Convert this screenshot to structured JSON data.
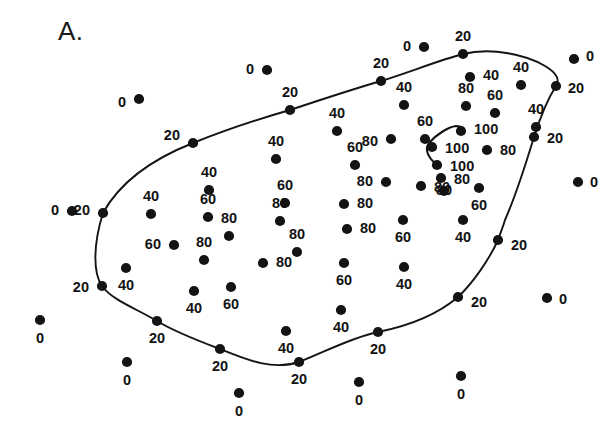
{
  "figure": {
    "panel_label": "A.",
    "marker_color": "#141414",
    "contour_color": "#141414",
    "background_color": "#ffffff"
  },
  "chart_data": {
    "type": "scatter",
    "title": "A.",
    "subtitle": "",
    "xlabel": "",
    "ylabel": "",
    "xlim": [
      0,
      615
    ],
    "ylim": [
      0,
      428
    ],
    "grid": false,
    "legend": "none",
    "value_label_key": "Percent value annotated beside each sampled point",
    "contour_levels": [
      20,
      100
    ],
    "series": [
      {
        "name": "Sampled points with percent labels",
        "points": [
          {
            "x": 267,
            "y": 70,
            "value": "0",
            "lx": 254,
            "ly": 70,
            "anchor": "end"
          },
          {
            "x": 139,
            "y": 99,
            "value": "0",
            "lx": 126,
            "ly": 103,
            "anchor": "end"
          },
          {
            "x": 424,
            "y": 47,
            "value": "0",
            "lx": 411,
            "ly": 47,
            "anchor": "end"
          },
          {
            "x": 574,
            "y": 59,
            "value": "0",
            "lx": 586,
            "ly": 57,
            "anchor": "start"
          },
          {
            "x": 578,
            "y": 182,
            "value": "0",
            "lx": 590,
            "ly": 183,
            "anchor": "start"
          },
          {
            "x": 547,
            "y": 298,
            "value": "0",
            "lx": 559,
            "ly": 300,
            "anchor": "start"
          },
          {
            "x": 72,
            "y": 211,
            "value": "0",
            "lx": 59,
            "ly": 211,
            "anchor": "end"
          },
          {
            "x": 40,
            "y": 320,
            "value": "0",
            "lx": 40,
            "ly": 339,
            "anchor": "middle"
          },
          {
            "x": 127,
            "y": 362,
            "value": "0",
            "lx": 127,
            "ly": 381,
            "anchor": "middle"
          },
          {
            "x": 239,
            "y": 393,
            "value": "0",
            "lx": 239,
            "ly": 412,
            "anchor": "middle"
          },
          {
            "x": 359,
            "y": 382,
            "value": "0",
            "lx": 359,
            "ly": 401,
            "anchor": "middle"
          },
          {
            "x": 461,
            "y": 376,
            "value": "0",
            "lx": 461,
            "ly": 395,
            "anchor": "middle"
          },
          {
            "x": 290,
            "y": 110,
            "value": "20",
            "lx": 290,
            "ly": 93,
            "anchor": "middle"
          },
          {
            "x": 193,
            "y": 143,
            "value": "20",
            "lx": 180,
            "ly": 136,
            "anchor": "end"
          },
          {
            "x": 381,
            "y": 81,
            "value": "20",
            "lx": 381,
            "ly": 64,
            "anchor": "middle"
          },
          {
            "x": 463,
            "y": 54,
            "value": "20",
            "lx": 463,
            "ly": 37,
            "anchor": "middle"
          },
          {
            "x": 556,
            "y": 86,
            "value": "20",
            "lx": 568,
            "ly": 89,
            "anchor": "start"
          },
          {
            "x": 534,
            "y": 137,
            "value": "20",
            "lx": 547,
            "ly": 139,
            "anchor": "start"
          },
          {
            "x": 498,
            "y": 240,
            "value": "20",
            "lx": 511,
            "ly": 246,
            "anchor": "start"
          },
          {
            "x": 458,
            "y": 297,
            "value": "20",
            "lx": 471,
            "ly": 303,
            "anchor": "start"
          },
          {
            "x": 378,
            "y": 332,
            "value": "20",
            "lx": 378,
            "ly": 350,
            "anchor": "middle"
          },
          {
            "x": 299,
            "y": 362,
            "value": "20",
            "lx": 299,
            "ly": 380,
            "anchor": "middle"
          },
          {
            "x": 220,
            "y": 349,
            "value": "20",
            "lx": 220,
            "ly": 367,
            "anchor": "middle"
          },
          {
            "x": 157,
            "y": 321,
            "value": "20",
            "lx": 157,
            "ly": 339,
            "anchor": "middle"
          },
          {
            "x": 102,
            "y": 286,
            "value": "20",
            "lx": 89,
            "ly": 288,
            "anchor": "end"
          },
          {
            "x": 103,
            "y": 213,
            "value": "20",
            "lx": 90,
            "ly": 211,
            "anchor": "end"
          },
          {
            "x": 151,
            "y": 214,
            "value": "40",
            "lx": 151,
            "ly": 197,
            "anchor": "middle"
          },
          {
            "x": 209,
            "y": 190,
            "value": "40",
            "lx": 209,
            "ly": 173,
            "anchor": "middle"
          },
          {
            "x": 276,
            "y": 159,
            "value": "40",
            "lx": 276,
            "ly": 142,
            "anchor": "middle"
          },
          {
            "x": 337,
            "y": 131,
            "value": "40",
            "lx": 337,
            "ly": 114,
            "anchor": "middle"
          },
          {
            "x": 404,
            "y": 105,
            "value": "40",
            "lx": 404,
            "ly": 88,
            "anchor": "middle"
          },
          {
            "x": 470,
            "y": 77,
            "value": "40",
            "lx": 483,
            "ly": 76,
            "anchor": "start"
          },
          {
            "x": 521,
            "y": 85,
            "value": "40",
            "lx": 521,
            "ly": 68,
            "anchor": "middle"
          },
          {
            "x": 536,
            "y": 127,
            "value": "40",
            "lx": 536,
            "ly": 110,
            "anchor": "middle"
          },
          {
            "x": 463,
            "y": 220,
            "value": "40",
            "lx": 463,
            "ly": 238,
            "anchor": "middle"
          },
          {
            "x": 404,
            "y": 267,
            "value": "40",
            "lx": 404,
            "ly": 285,
            "anchor": "middle"
          },
          {
            "x": 341,
            "y": 310,
            "value": "40",
            "lx": 341,
            "ly": 328,
            "anchor": "middle"
          },
          {
            "x": 286,
            "y": 331,
            "value": "40",
            "lx": 286,
            "ly": 349,
            "anchor": "middle"
          },
          {
            "x": 194,
            "y": 291,
            "value": "40",
            "lx": 194,
            "ly": 309,
            "anchor": "middle"
          },
          {
            "x": 126,
            "y": 268,
            "value": "40",
            "lx": 126,
            "ly": 286,
            "anchor": "middle"
          },
          {
            "x": 208,
            "y": 217,
            "value": "60",
            "lx": 208,
            "ly": 200,
            "anchor": "middle"
          },
          {
            "x": 285,
            "y": 203,
            "value": "60",
            "lx": 285,
            "ly": 186,
            "anchor": "middle"
          },
          {
            "x": 355,
            "y": 165,
            "value": "60",
            "lx": 355,
            "ly": 148,
            "anchor": "middle"
          },
          {
            "x": 425,
            "y": 139,
            "value": "60",
            "lx": 425,
            "ly": 122,
            "anchor": "middle"
          },
          {
            "x": 495,
            "y": 113,
            "value": "60",
            "lx": 495,
            "ly": 96,
            "anchor": "middle"
          },
          {
            "x": 479,
            "y": 188,
            "value": "60",
            "lx": 479,
            "ly": 206,
            "anchor": "middle"
          },
          {
            "x": 403,
            "y": 220,
            "value": "60",
            "lx": 403,
            "ly": 238,
            "anchor": "middle"
          },
          {
            "x": 344,
            "y": 263,
            "value": "60",
            "lx": 344,
            "ly": 281,
            "anchor": "middle"
          },
          {
            "x": 231,
            "y": 287,
            "value": "60",
            "lx": 231,
            "ly": 305,
            "anchor": "middle"
          },
          {
            "x": 174,
            "y": 245,
            "value": "60",
            "lx": 161,
            "ly": 245,
            "anchor": "end"
          },
          {
            "x": 229,
            "y": 236,
            "value": "80",
            "lx": 229,
            "ly": 219,
            "anchor": "middle"
          },
          {
            "x": 280,
            "y": 221,
            "value": "80",
            "lx": 280,
            "ly": 204,
            "anchor": "middle"
          },
          {
            "x": 297,
            "y": 252,
            "value": "80",
            "lx": 297,
            "ly": 235,
            "anchor": "middle"
          },
          {
            "x": 263,
            "y": 263,
            "value": "80",
            "lx": 276,
            "ly": 263,
            "anchor": "start"
          },
          {
            "x": 204,
            "y": 260,
            "value": "80",
            "lx": 204,
            "ly": 243,
            "anchor": "middle"
          },
          {
            "x": 344,
            "y": 204,
            "value": "80",
            "lx": 357,
            "ly": 204,
            "anchor": "start"
          },
          {
            "x": 347,
            "y": 229,
            "value": "80",
            "lx": 360,
            "ly": 229,
            "anchor": "start"
          },
          {
            "x": 386,
            "y": 182,
            "value": "80",
            "lx": 373,
            "ly": 182,
            "anchor": "end"
          },
          {
            "x": 421,
            "y": 186,
            "value": "80",
            "lx": 434,
            "ly": 188,
            "anchor": "start"
          },
          {
            "x": 444,
            "y": 191,
            "value": "80",
            "lx": 444,
            "ly": 191,
            "anchor": "middle"
          },
          {
            "x": 466,
            "y": 106,
            "value": "80",
            "lx": 466,
            "ly": 89,
            "anchor": "middle"
          },
          {
            "x": 391,
            "y": 139,
            "value": "80",
            "lx": 378,
            "ly": 142,
            "anchor": "end"
          },
          {
            "x": 441,
            "y": 178,
            "value": "80",
            "lx": 454,
            "ly": 180,
            "anchor": "start"
          },
          {
            "x": 487,
            "y": 150,
            "value": "80",
            "lx": 500,
            "ly": 151,
            "anchor": "start"
          },
          {
            "x": 461,
            "y": 131,
            "value": "100",
            "lx": 474,
            "ly": 130,
            "anchor": "start"
          },
          {
            "x": 432,
            "y": 147,
            "value": "100",
            "lx": 445,
            "ly": 149,
            "anchor": "start"
          },
          {
            "x": 437,
            "y": 165,
            "value": "100",
            "lx": 450,
            "ly": 167,
            "anchor": "start"
          }
        ]
      }
    ],
    "contours": [
      {
        "level": 20,
        "closed": true,
        "description": "Main outer boundary enclosing the high-value region"
      },
      {
        "level": 100,
        "closed": false,
        "description": "Small inner hook-shaped contour around the peak"
      }
    ]
  }
}
